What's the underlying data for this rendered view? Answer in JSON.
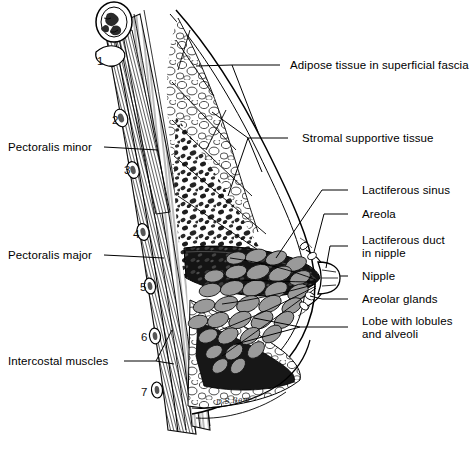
{
  "figure": {
    "signature": "D.S.Rem",
    "background_color": "#ffffff",
    "ink_color": "#000000",
    "lobule_fill": "#9a9a9a",
    "sinus_fill": "#141414"
  },
  "labels_right": [
    {
      "id": "adipose",
      "text": "Adipose tissue in superficial fascia",
      "x": 290,
      "y": 59,
      "dash_x": 280,
      "dash_y": 65
    },
    {
      "id": "stromal",
      "text": "Stromal supportive tissue",
      "x": 302,
      "y": 132,
      "dash_x": 288,
      "dash_y": 138
    },
    {
      "id": "sinus",
      "text": "Lactiferous sinus",
      "x": 362,
      "y": 184,
      "dash_x": 348,
      "dash_y": 190
    },
    {
      "id": "areola",
      "text": "Areola",
      "x": 362,
      "y": 208,
      "dash_x": 348,
      "dash_y": 214
    },
    {
      "id": "duct",
      "text": "Lactiferous duct\nin nipple",
      "x": 362,
      "y": 234,
      "dash_x": 348,
      "dash_y": 246
    },
    {
      "id": "nipple",
      "text": "Nipple",
      "x": 362,
      "y": 270,
      "dash_x": 348,
      "dash_y": 276
    },
    {
      "id": "areolar",
      "text": "Areolar glands",
      "x": 362,
      "y": 293,
      "dash_x": 348,
      "dash_y": 299
    },
    {
      "id": "lobe",
      "text": "Lobe with lobules\nand alveoli",
      "x": 362,
      "y": 315,
      "dash_x": 348,
      "dash_y": 327
    }
  ],
  "labels_left": [
    {
      "id": "pect-minor",
      "text": "Pectoralis minor",
      "x": 8,
      "y": 141,
      "line_from_x": 104,
      "line_to_x": 150,
      "line_y": 147
    },
    {
      "id": "pect-major",
      "text": "Pectoralis major",
      "x": 8,
      "y": 249,
      "line_from_x": 104,
      "line_to_x": 158,
      "line_y": 255
    },
    {
      "id": "intercostal",
      "text": "Intercostal muscles",
      "x": 8,
      "y": 355,
      "line_from_x": 124,
      "line_to_x": 168,
      "line_y": 361
    }
  ],
  "rib_numbers": [
    {
      "label": "1",
      "x": 97,
      "y": 55
    },
    {
      "label": "2",
      "x": 112,
      "y": 114
    },
    {
      "label": "3",
      "x": 124,
      "y": 164
    },
    {
      "label": "4",
      "x": 133,
      "y": 228
    },
    {
      "label": "5",
      "x": 140,
      "y": 281
    },
    {
      "label": "6",
      "x": 141,
      "y": 331
    },
    {
      "label": "7",
      "x": 141,
      "y": 386
    }
  ]
}
